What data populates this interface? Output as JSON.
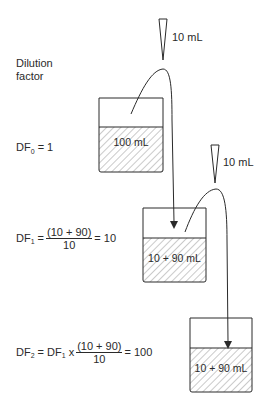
{
  "title": {
    "line1": "Dilution",
    "line2": "factor"
  },
  "pipettes": [
    {
      "volume_label": "10 mL"
    },
    {
      "volume_label": "10 mL"
    }
  ],
  "beakers": [
    {
      "content_label": "100 mL"
    },
    {
      "content_label": "10 + 90 mL"
    },
    {
      "content_label": "10 + 90 mL"
    }
  ],
  "equations": {
    "df0": {
      "lhs": "DF",
      "sub": "0",
      "rhs": "= 1"
    },
    "df1": {
      "lhs": "DF",
      "sub": "1",
      "eq": "=",
      "numerator": "(10 + 90)",
      "denominator": "10",
      "result": "= 10"
    },
    "df2": {
      "lhs": "DF",
      "sub": "2",
      "eq": "= DF",
      "sub2": "1",
      "times": "x",
      "numerator": "(10 + 90)",
      "denominator": "10",
      "result": "= 100"
    }
  },
  "colors": {
    "stroke": "#2a2a2a",
    "hatch": "#555555",
    "background": "#ffffff"
  }
}
